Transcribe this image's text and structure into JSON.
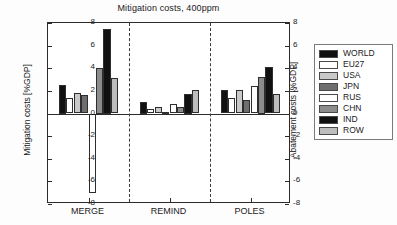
{
  "chart_data": {
    "type": "bar",
    "title": "Mitigation costs, 400ppm",
    "xlabel": "",
    "ylabel": "Mitigation costs [%GDP]",
    "ylabel_right": "Abatement costs [%GDP]",
    "ylim": [
      -8,
      8
    ],
    "yticks": [
      8,
      6,
      4,
      2,
      0,
      -2,
      -4,
      -6,
      -8
    ],
    "ytick_labels": [
      "8",
      "6",
      "4",
      "2",
      "0",
      "-2",
      "-4",
      "-6",
      "-8"
    ],
    "grid": false,
    "legend_position": "right-outside",
    "categories": [
      "MERGE",
      "REMIND",
      "POLES"
    ],
    "series": [
      {
        "name": "WORLD",
        "color": "#111111",
        "values": [
          2.5,
          1.0,
          2.05
        ]
      },
      {
        "name": "EU27",
        "color": "#ffffff",
        "values": [
          1.35,
          0.4,
          1.35
        ]
      },
      {
        "name": "USA",
        "color": "#c9c9c9",
        "values": [
          1.85,
          0.55,
          2.05
        ]
      },
      {
        "name": "JPN",
        "color": "#6e6e6e",
        "values": [
          1.6,
          0.15,
          1.2
        ]
      },
      {
        "name": "RUS",
        "color": "#ffffff",
        "values": [
          -7.0,
          0.85,
          2.45
        ]
      },
      {
        "name": "CHN",
        "color": "#8c8c8c",
        "values": [
          4.0,
          0.6,
          3.25
        ]
      },
      {
        "name": "IND",
        "color": "#111111",
        "values": [
          7.5,
          1.75,
          4.1
        ]
      },
      {
        "name": "ROW",
        "color": "#bdbdbd",
        "values": [
          3.1,
          2.05,
          1.7
        ]
      }
    ]
  },
  "legend": {
    "entries": [
      {
        "label": "WORLD",
        "color": "#111111"
      },
      {
        "label": "EU27",
        "color": "#ffffff"
      },
      {
        "label": "USA",
        "color": "#c9c9c9"
      },
      {
        "label": "JPN",
        "color": "#6e6e6e"
      },
      {
        "label": "RUS",
        "color": "#ffffff"
      },
      {
        "label": "CHN",
        "color": "#8c8c8c"
      },
      {
        "label": "IND",
        "color": "#111111"
      },
      {
        "label": "ROW",
        "color": "#bdbdbd"
      }
    ]
  }
}
